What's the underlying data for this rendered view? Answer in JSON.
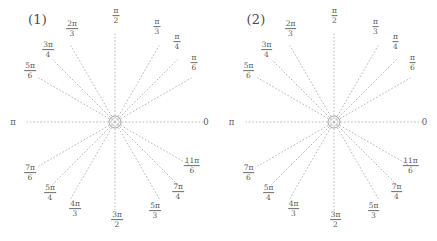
{
  "figure": {
    "background": "#ffffff",
    "line_color": "#b9b9b9",
    "text_color": "#5a5a5a",
    "center_circle_color": "#9a9a9a"
  },
  "panels": [
    {
      "tag": "(1)",
      "center": {
        "x": 115,
        "y": 122
      },
      "radius": 88,
      "inner_circle_radius": 6,
      "axis_labels": {
        "left": {
          "text": "π",
          "x": 13,
          "y": 122
        },
        "right": {
          "text": "0",
          "x": 206,
          "y": 122
        }
      },
      "spokes": [
        {
          "angle_deg": 0,
          "label_num": "",
          "label_den": "",
          "label_plain": "0",
          "label_x": 206,
          "label_y": 122,
          "has_label": false
        },
        {
          "angle_deg": 30,
          "label_num": "π",
          "label_den": "6",
          "label_plain": "",
          "label_x": 194,
          "label_y": 63,
          "has_label": true
        },
        {
          "angle_deg": 45,
          "label_num": "π",
          "label_den": "4",
          "label_plain": "",
          "label_x": 177,
          "label_y": 42,
          "has_label": true
        },
        {
          "angle_deg": 60,
          "label_num": "π",
          "label_den": "3",
          "label_plain": "",
          "label_x": 157,
          "label_y": 27,
          "has_label": true
        },
        {
          "angle_deg": 90,
          "label_num": "π",
          "label_den": "2",
          "label_plain": "",
          "label_x": 116,
          "label_y": 16,
          "has_label": true
        },
        {
          "angle_deg": 120,
          "label_num": "2π",
          "label_den": "3",
          "label_plain": "",
          "label_x": 72,
          "label_y": 29,
          "has_label": true
        },
        {
          "angle_deg": 135,
          "label_num": "3π",
          "label_den": "4",
          "label_plain": "",
          "label_x": 48,
          "label_y": 50,
          "has_label": true
        },
        {
          "angle_deg": 150,
          "label_num": "5π",
          "label_den": "6",
          "label_plain": "",
          "label_x": 30,
          "label_y": 71,
          "has_label": true
        },
        {
          "angle_deg": 180,
          "label_num": "",
          "label_den": "",
          "label_plain": "π",
          "label_x": 13,
          "label_y": 122,
          "has_label": false
        },
        {
          "angle_deg": 210,
          "label_num": "7π",
          "label_den": "6",
          "label_plain": "",
          "label_x": 30,
          "label_y": 173,
          "has_label": true
        },
        {
          "angle_deg": 225,
          "label_num": "5π",
          "label_den": "4",
          "label_plain": "",
          "label_x": 50,
          "label_y": 193,
          "has_label": true
        },
        {
          "angle_deg": 240,
          "label_num": "4π",
          "label_den": "3",
          "label_plain": "",
          "label_x": 75,
          "label_y": 209,
          "has_label": true
        },
        {
          "angle_deg": 270,
          "label_num": "3π",
          "label_den": "2",
          "label_plain": "",
          "label_x": 117,
          "label_y": 220,
          "has_label": true
        },
        {
          "angle_deg": 300,
          "label_num": "5π",
          "label_den": "3",
          "label_plain": "",
          "label_x": 155,
          "label_y": 211,
          "has_label": true
        },
        {
          "angle_deg": 315,
          "label_num": "7π",
          "label_den": "4",
          "label_plain": "",
          "label_x": 178,
          "label_y": 192,
          "has_label": true
        },
        {
          "angle_deg": 330,
          "label_num": "11π",
          "label_den": "6",
          "label_plain": "",
          "label_x": 192,
          "label_y": 166,
          "has_label": true
        }
      ]
    },
    {
      "tag": "(2)",
      "center": {
        "x": 115,
        "y": 122
      },
      "radius": 88,
      "inner_circle_radius": 6,
      "axis_labels": {
        "left": {
          "text": "π",
          "x": 13,
          "y": 122
        },
        "right": {
          "text": "0",
          "x": 206,
          "y": 122
        }
      },
      "spokes": [
        {
          "angle_deg": 0,
          "label_num": "",
          "label_den": "",
          "label_plain": "0",
          "label_x": 206,
          "label_y": 122,
          "has_label": false
        },
        {
          "angle_deg": 30,
          "label_num": "π",
          "label_den": "6",
          "label_plain": "",
          "label_x": 194,
          "label_y": 63,
          "has_label": true
        },
        {
          "angle_deg": 45,
          "label_num": "π",
          "label_den": "4",
          "label_plain": "",
          "label_x": 177,
          "label_y": 42,
          "has_label": true
        },
        {
          "angle_deg": 60,
          "label_num": "π",
          "label_den": "3",
          "label_plain": "",
          "label_x": 157,
          "label_y": 27,
          "has_label": true
        },
        {
          "angle_deg": 90,
          "label_num": "π",
          "label_den": "2",
          "label_plain": "",
          "label_x": 116,
          "label_y": 16,
          "has_label": true
        },
        {
          "angle_deg": 120,
          "label_num": "2π",
          "label_den": "3",
          "label_plain": "",
          "label_x": 72,
          "label_y": 29,
          "has_label": true
        },
        {
          "angle_deg": 135,
          "label_num": "3π",
          "label_den": "4",
          "label_plain": "",
          "label_x": 48,
          "label_y": 50,
          "has_label": true
        },
        {
          "angle_deg": 150,
          "label_num": "5π",
          "label_den": "6",
          "label_plain": "",
          "label_x": 30,
          "label_y": 71,
          "has_label": true
        },
        {
          "angle_deg": 180,
          "label_num": "",
          "label_den": "",
          "label_plain": "π",
          "label_x": 13,
          "label_y": 122,
          "has_label": false
        },
        {
          "angle_deg": 210,
          "label_num": "7π",
          "label_den": "6",
          "label_plain": "",
          "label_x": 30,
          "label_y": 173,
          "has_label": true
        },
        {
          "angle_deg": 225,
          "label_num": "5π",
          "label_den": "4",
          "label_plain": "",
          "label_x": 50,
          "label_y": 193,
          "has_label": true
        },
        {
          "angle_deg": 240,
          "label_num": "4π",
          "label_den": "3",
          "label_plain": "",
          "label_x": 75,
          "label_y": 209,
          "has_label": true
        },
        {
          "angle_deg": 270,
          "label_num": "3π",
          "label_den": "2",
          "label_plain": "",
          "label_x": 117,
          "label_y": 220,
          "has_label": true
        },
        {
          "angle_deg": 300,
          "label_num": "5π",
          "label_den": "3",
          "label_plain": "",
          "label_x": 155,
          "label_y": 211,
          "has_label": true
        },
        {
          "angle_deg": 315,
          "label_num": "7π",
          "label_den": "4",
          "label_plain": "",
          "label_x": 178,
          "label_y": 192,
          "has_label": true
        },
        {
          "angle_deg": 330,
          "label_num": "11π",
          "label_den": "6",
          "label_plain": "",
          "label_x": 192,
          "label_y": 166,
          "has_label": true
        }
      ]
    }
  ]
}
